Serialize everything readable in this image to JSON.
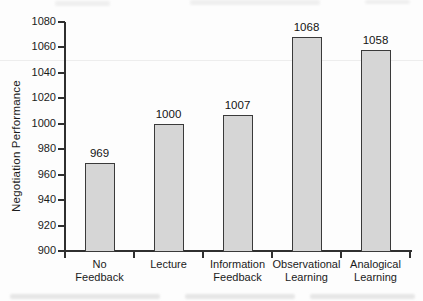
{
  "figure": {
    "background": "#fdfdfd",
    "ylabel": "Negotiation Performance"
  },
  "chart_data": {
    "type": "bar",
    "title": "",
    "xlabel": "",
    "ylabel": "Negotiation Performance",
    "ylim": [
      900,
      1080
    ],
    "ytick_step": 20,
    "yticks": [
      900,
      920,
      940,
      960,
      980,
      1000,
      1020,
      1040,
      1060,
      1080
    ],
    "grid": false,
    "legend_position": "none",
    "categories": [
      "No Feedback",
      "Lecture",
      "Information Feedback",
      "Observational Learning",
      "Analogical Learning"
    ],
    "category_lines": [
      [
        "No",
        "Feedback"
      ],
      [
        "Lecture"
      ],
      [
        "Information",
        "Feedback"
      ],
      [
        "Observational",
        "Learning"
      ],
      [
        "Analogical",
        "Learning"
      ]
    ],
    "values": [
      969,
      1000,
      1007,
      1068,
      1058
    ],
    "bar_value_labels": [
      "969",
      "1000",
      "1007",
      "1068",
      "1058"
    ]
  },
  "colors": {
    "bar_fill": "#d6d6d6",
    "bar_border": "#3a3a3a",
    "axis": "#2f2f2f",
    "text": "#1b1b1b",
    "scan_artifact": "#ededed"
  }
}
